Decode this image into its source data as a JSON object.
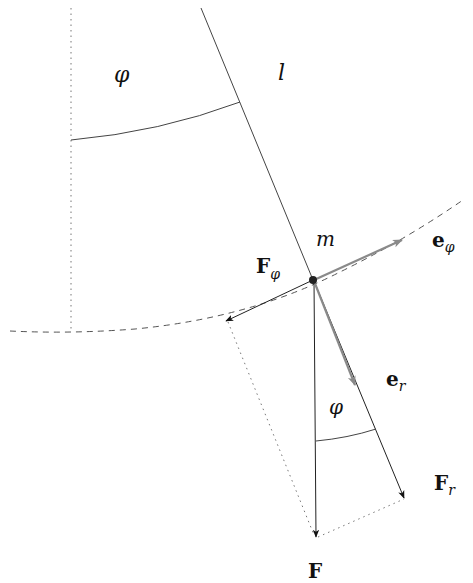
{
  "diagram": {
    "labels": {
      "angle_top": "φ",
      "length": "l",
      "mass": "m",
      "force_phi_main": "F",
      "force_phi_sub": "φ",
      "unit_phi_main": "e",
      "unit_phi_sub": "φ",
      "unit_r_main": "e",
      "unit_r_sub": "r",
      "angle_bottom": "φ",
      "force_r_main": "F",
      "force_r_sub": "r",
      "force": "F"
    },
    "colors": {
      "line": "#333333",
      "unit_vector": "#8a8a8a",
      "dashed": "#555555",
      "dotted": "#777777"
    }
  }
}
